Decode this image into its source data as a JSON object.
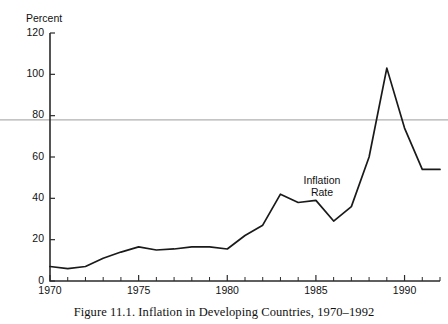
{
  "caption": "Figure 11.1. Inflation in Developing Countries, 1970–1992",
  "annotation": {
    "line1": "Inflation",
    "line2": "Rate"
  },
  "colors": {
    "series": "#1a1a1a",
    "axis": "#2b2b2b",
    "reference_rule": "#b0b0b0",
    "background": "#ffffff",
    "text": "#111111"
  },
  "chart_data": {
    "type": "line",
    "title": "Figure 11.1. Inflation in Developing Countries, 1970–1992",
    "xlabel": "",
    "ylabel": "Percent",
    "yaxis_title": "Percent",
    "xlim": [
      1970,
      1992
    ],
    "ylim": [
      0,
      120
    ],
    "ytick_labels": [
      "0",
      "20",
      "40",
      "60",
      "80",
      "100",
      "120"
    ],
    "yticks": [
      0,
      20,
      40,
      60,
      80,
      100,
      120
    ],
    "xtick_labels": [
      "1970",
      "1975",
      "1980",
      "1985",
      "1990"
    ],
    "xticks": [
      1970,
      1975,
      1980,
      1985,
      1990
    ],
    "xminor_ticks": [
      1970,
      1971,
      1972,
      1973,
      1974,
      1975,
      1976,
      1977,
      1978,
      1979,
      1980,
      1981,
      1982,
      1983,
      1984,
      1985,
      1986,
      1987,
      1988,
      1989,
      1990,
      1991,
      1992
    ],
    "grid": false,
    "legend": null,
    "reference_line": {
      "y": 78,
      "orientation": "horizontal",
      "color": "#b0b0b0",
      "spans_full_width": true
    },
    "annotations": [
      {
        "text": "Inflation Rate",
        "x": 1986.6,
        "y": 52
      }
    ],
    "series": [
      {
        "name": "Inflation Rate",
        "x": [
          1970,
          1971,
          1972,
          1973,
          1974,
          1975,
          1976,
          1977,
          1978,
          1979,
          1980,
          1981,
          1982,
          1983,
          1984,
          1985,
          1986,
          1987,
          1988,
          1989,
          1990,
          1991,
          1992
        ],
        "values": [
          7,
          6,
          7,
          11,
          14,
          16.5,
          15,
          15.5,
          16.5,
          16.5,
          15.5,
          22,
          27,
          42,
          38,
          39,
          29,
          36,
          60,
          103,
          74,
          54,
          54
        ]
      }
    ]
  }
}
